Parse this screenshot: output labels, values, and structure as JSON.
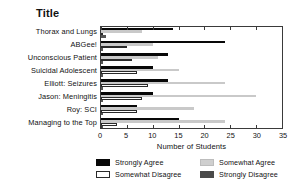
{
  "chart_data": {
    "type": "bar",
    "orientation": "horizontal",
    "title": "Title",
    "xlabel": "Number of Students",
    "ylabel": "",
    "xlim": [
      0,
      35
    ],
    "xticks": [
      0,
      5,
      10,
      15,
      20,
      25,
      30,
      35
    ],
    "grid": false,
    "legend_position": "bottom",
    "categories": [
      "Thorax and Lungs",
      "ABGee!",
      "Unconscious Patient",
      "Suicidal Adolescent",
      "Elliott:  Seizures",
      "Jason:  Meningitis",
      "Roy:  SCI",
      "Managing to the Top"
    ],
    "series": [
      {
        "name": "Strongly Agree",
        "color": "#080808",
        "values": [
          14,
          24,
          13,
          10,
          13,
          10,
          7,
          15
        ]
      },
      {
        "name": "Somewhat Agree",
        "color": "#c9c9c9",
        "values": [
          8,
          10,
          11,
          15,
          24,
          30,
          18,
          24
        ]
      },
      {
        "name": "Somewhat Disagree",
        "color": "#ffffff",
        "values": [
          0,
          5,
          6,
          7,
          9,
          8,
          7,
          3
        ]
      },
      {
        "name": "Strongly Disagree",
        "color": "#555555",
        "values": [
          1,
          0,
          0,
          0,
          0,
          0,
          0,
          0
        ]
      }
    ]
  }
}
